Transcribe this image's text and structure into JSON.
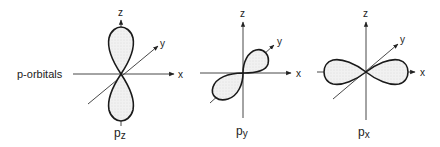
{
  "diagram": {
    "row_label": "p-orbitals",
    "orbitals": [
      {
        "id": "pz",
        "name": "p",
        "subscript": "z",
        "axis_labels": {
          "x": "x",
          "y": "y",
          "z": "z"
        }
      },
      {
        "id": "py",
        "name": "p",
        "subscript": "y",
        "axis_labels": {
          "x": "x",
          "y": "y",
          "z": "z"
        }
      },
      {
        "id": "px",
        "name": "p",
        "subscript": "x",
        "axis_labels": {
          "x": "x",
          "y": "y",
          "z": "z"
        }
      }
    ],
    "colors": {
      "line": "#1a1a1a",
      "axis": "#333333",
      "lobe_fill": "#ededed",
      "background": "#ffffff"
    }
  }
}
